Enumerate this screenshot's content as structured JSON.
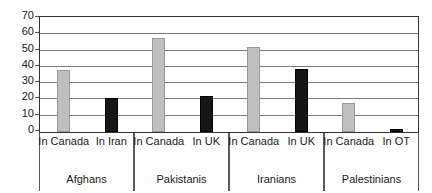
{
  "chart_data": {
    "type": "bar",
    "title": "",
    "subtitle": "",
    "xlabel": "",
    "ylabel": "",
    "ylim": [
      0,
      70
    ],
    "yticks": [
      0,
      10,
      20,
      30,
      40,
      50,
      60,
      70
    ],
    "ytick_labels": [
      "0",
      "10",
      "20",
      "30",
      "40",
      "50",
      "60",
      "70"
    ],
    "grid": true,
    "legend": "none",
    "categories": [
      "Afghans",
      "Pakistanis",
      "Iranians",
      "Palestinians"
    ],
    "groups": [
      {
        "name": "Afghans",
        "bars": [
          {
            "label": "In Canada",
            "value": 38,
            "color": "#bfbfbf"
          },
          {
            "label": "In Iran",
            "value": 21,
            "color": "#161616"
          }
        ]
      },
      {
        "name": "Pakistanis",
        "bars": [
          {
            "label": "In Canada",
            "value": 58,
            "color": "#bfbfbf"
          },
          {
            "label": "In UK",
            "value": 22,
            "color": "#161616"
          }
        ]
      },
      {
        "name": "Iranians",
        "bars": [
          {
            "label": "In Canada",
            "value": 52,
            "color": "#bfbfbf"
          },
          {
            "label": "In UK",
            "value": 39,
            "color": "#161616"
          }
        ]
      },
      {
        "name": "Palestinians",
        "bars": [
          {
            "label": "In Canada",
            "value": 18,
            "color": "#bfbfbf"
          },
          {
            "label": "In OT",
            "value": 2,
            "color": "#161616"
          }
        ]
      }
    ],
    "series": [
      {
        "name": "In Canada",
        "values": [
          38,
          58,
          52,
          18
        ],
        "color": "#bfbfbf"
      },
      {
        "name": "In comparison country",
        "values": [
          21,
          22,
          39,
          2
        ],
        "color": "#161616"
      }
    ],
    "colors": {
      "gray_bar": "#bfbfbf",
      "black_bar": "#161616",
      "gridline": "#7a7a7a",
      "axis": "#333333",
      "background": "#ffffff",
      "text": "#1a1a1a"
    }
  }
}
